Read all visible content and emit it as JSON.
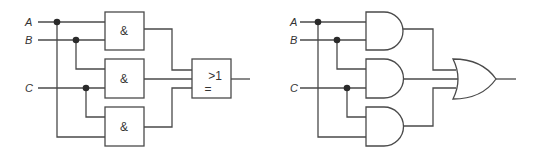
{
  "diagrams": [
    {
      "name": "iec-symbol-circuit",
      "inputs": [
        "A",
        "B",
        "C"
      ],
      "and_gates": [
        {
          "symbol": "&",
          "inputs": [
            "A",
            "B"
          ]
        },
        {
          "symbol": "&",
          "inputs": [
            "B",
            "C"
          ]
        },
        {
          "symbol": "&",
          "inputs": [
            "C",
            "A"
          ]
        }
      ],
      "or_gate": {
        "symbol_top": ">1",
        "symbol_bottom": "="
      }
    },
    {
      "name": "ansi-symbol-circuit",
      "inputs": [
        "A",
        "B",
        "C"
      ],
      "and_gates": [
        {
          "inputs": [
            "A",
            "B"
          ]
        },
        {
          "inputs": [
            "B",
            "C"
          ]
        },
        {
          "inputs": [
            "C",
            "A"
          ]
        }
      ],
      "or_gate": {}
    }
  ]
}
